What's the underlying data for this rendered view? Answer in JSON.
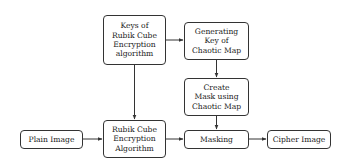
{
  "diagram": {
    "nodes": [
      {
        "id": "keys",
        "label": "Keys of\nRubik Cube\nEncryption\nalgorithm"
      },
      {
        "id": "gen",
        "label": "Generating\nKey of\nChaotic Map"
      },
      {
        "id": "mask",
        "label": "Create\nMask using\nChaotic Map"
      },
      {
        "id": "plain",
        "label": "Plain Image"
      },
      {
        "id": "rubik",
        "label": "Rubik Cube\nEncryption\nAlgorithm"
      },
      {
        "id": "masking",
        "label": "Masking"
      },
      {
        "id": "cipher",
        "label": "Cipher Image"
      }
    ],
    "edges": [
      {
        "from": "keys",
        "to": "gen"
      },
      {
        "from": "keys",
        "to": "rubik"
      },
      {
        "from": "gen",
        "to": "mask"
      },
      {
        "from": "mask",
        "to": "masking"
      },
      {
        "from": "plain",
        "to": "rubik"
      },
      {
        "from": "rubik",
        "to": "masking"
      },
      {
        "from": "masking",
        "to": "cipher"
      }
    ]
  }
}
